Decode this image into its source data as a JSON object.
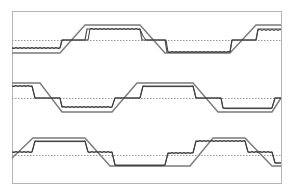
{
  "diagram": {
    "title": "",
    "frame": {
      "x": 12,
      "y": 11,
      "w": 269,
      "h": 172,
      "color": "#b5b5b5"
    },
    "colors": {
      "envelope": "#7a7a7a",
      "signal": "#3c3c3c",
      "step": "#4a4a4a",
      "midline": "#9a9a9a"
    },
    "bands": [
      {
        "name": "band-1",
        "mid": 40,
        "envelope": [
          [
            12,
            53
          ],
          [
            60,
            53
          ],
          [
            85,
            25
          ],
          [
            140,
            25
          ],
          [
            165,
            53
          ],
          [
            230,
            53
          ],
          [
            256,
            25
          ],
          [
            281,
            25
          ]
        ],
        "step": [
          [
            12,
            48
          ],
          [
            60,
            48
          ],
          [
            62,
            40
          ],
          [
            85,
            40
          ],
          [
            87,
            29
          ],
          [
            140,
            29
          ],
          [
            142,
            40
          ],
          [
            165,
            40
          ],
          [
            167,
            52
          ],
          [
            230,
            52
          ],
          [
            232,
            40
          ],
          [
            256,
            40
          ],
          [
            258,
            29
          ],
          [
            281,
            29
          ]
        ],
        "signal": [
          [
            12,
            48
          ],
          [
            60,
            48
          ],
          [
            62,
            40
          ],
          [
            88,
            40
          ],
          [
            90,
            29
          ],
          [
            140,
            29
          ],
          [
            143,
            36
          ],
          [
            146,
            40
          ],
          [
            166,
            40
          ],
          [
            168,
            52
          ],
          [
            230,
            52
          ],
          [
            232,
            40
          ],
          [
            256,
            40
          ],
          [
            258,
            30
          ],
          [
            281,
            30
          ]
        ]
      },
      {
        "name": "band-2",
        "mid": 98,
        "envelope": [
          [
            12,
            83
          ],
          [
            40,
            83
          ],
          [
            62,
            112
          ],
          [
            112,
            112
          ],
          [
            137,
            83
          ],
          [
            193,
            83
          ],
          [
            218,
            112
          ],
          [
            272,
            112
          ],
          [
            281,
            98
          ]
        ],
        "step": [
          [
            12,
            86
          ],
          [
            32,
            86
          ],
          [
            35,
            98
          ],
          [
            60,
            98
          ],
          [
            62,
            107
          ],
          [
            112,
            107
          ],
          [
            115,
            98
          ],
          [
            140,
            98
          ],
          [
            143,
            86
          ],
          [
            193,
            86
          ],
          [
            196,
            98
          ],
          [
            221,
            98
          ],
          [
            223,
            108
          ],
          [
            272,
            108
          ],
          [
            275,
            98
          ],
          [
            281,
            98
          ]
        ],
        "signal": [
          [
            12,
            86
          ],
          [
            32,
            86
          ],
          [
            35,
            98
          ],
          [
            60,
            98
          ],
          [
            62,
            107
          ],
          [
            112,
            107
          ],
          [
            115,
            98
          ],
          [
            140,
            98
          ],
          [
            143,
            86
          ],
          [
            193,
            86
          ],
          [
            196,
            98
          ],
          [
            221,
            98
          ],
          [
            223,
            108
          ],
          [
            272,
            108
          ],
          [
            275,
            98
          ],
          [
            281,
            98
          ]
        ]
      },
      {
        "name": "band-3",
        "mid": 155,
        "envelope": [
          [
            12,
            158
          ],
          [
            33,
            138
          ],
          [
            85,
            138
          ],
          [
            110,
            166
          ],
          [
            190,
            166
          ],
          [
            213,
            138
          ],
          [
            245,
            138
          ],
          [
            272,
            166
          ],
          [
            281,
            166
          ]
        ],
        "step": [
          [
            12,
            152
          ],
          [
            32,
            152
          ],
          [
            35,
            141
          ],
          [
            85,
            141
          ],
          [
            88,
            152
          ],
          [
            112,
            152
          ],
          [
            115,
            165
          ],
          [
            165,
            165
          ],
          [
            168,
            153
          ],
          [
            193,
            153
          ],
          [
            196,
            141
          ],
          [
            245,
            141
          ],
          [
            248,
            152
          ],
          [
            272,
            152
          ],
          [
            275,
            163
          ],
          [
            281,
            163
          ]
        ],
        "signal": [
          [
            12,
            152
          ],
          [
            32,
            152
          ],
          [
            35,
            141
          ],
          [
            85,
            141
          ],
          [
            88,
            152
          ],
          [
            112,
            152
          ],
          [
            115,
            165
          ],
          [
            165,
            165
          ],
          [
            168,
            153
          ],
          [
            193,
            153
          ],
          [
            196,
            141
          ],
          [
            245,
            141
          ],
          [
            248,
            152
          ],
          [
            272,
            152
          ],
          [
            275,
            163
          ],
          [
            281,
            163
          ]
        ]
      }
    ]
  }
}
